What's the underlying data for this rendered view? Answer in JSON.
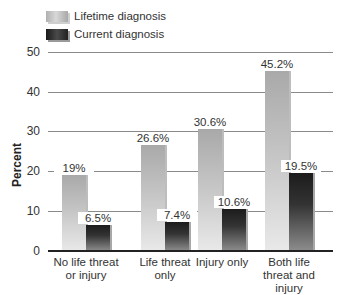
{
  "chart_data": {
    "type": "bar",
    "title": "",
    "xlabel": "",
    "ylabel": "Percent",
    "ylim": [
      0,
      50
    ],
    "yticks": [
      0,
      10,
      20,
      30,
      40,
      50
    ],
    "grid": true,
    "legend_position": "top-left",
    "categories": [
      "No life threat or injury",
      "Life threat only",
      "Injury only",
      "Both life threat and injury"
    ],
    "series": [
      {
        "name": "Lifetime diagnosis",
        "values": [
          19,
          26.6,
          30.6,
          45.2
        ],
        "labels": [
          "19%",
          "26.6%",
          "30.6%",
          "45.2%"
        ]
      },
      {
        "name": "Current diagnosis",
        "values": [
          6.5,
          7.4,
          10.6,
          19.5
        ],
        "labels": [
          "6.5%",
          "7.4%",
          "10.6%",
          "19.5%"
        ]
      }
    ]
  },
  "legend": {
    "lifetime": "Lifetime diagnosis",
    "current": "Current diagnosis"
  },
  "axis": {
    "ylabel": "Percent",
    "ticks": [
      "0",
      "10",
      "20",
      "30",
      "40",
      "50"
    ]
  },
  "xlabels": [
    "No life threat\nor injury",
    "Life threat\nonly",
    "Injury only",
    "Both life\nthreat and\ninjury"
  ],
  "colors": {
    "lifetime": "#c4c4c4",
    "current": "#333333",
    "grid": "#8a8a8a"
  }
}
